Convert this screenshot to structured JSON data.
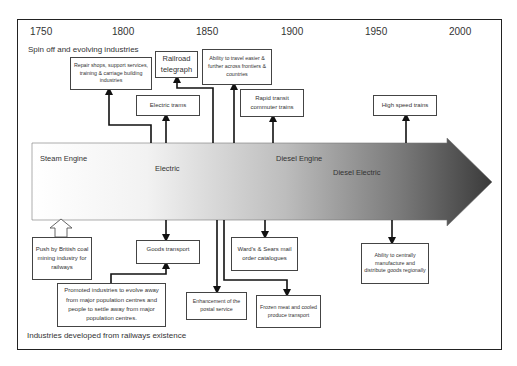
{
  "diagram": {
    "type": "timeline-flow-diagram",
    "years": [
      "1750",
      "1800",
      "1850",
      "1900",
      "1950",
      "2000"
    ],
    "top_section_label": "Spin off and evolving industries",
    "bottom_section_label": "Industries developed from railways existence",
    "timeline_arrow": {
      "eras": [
        "Steam Engine",
        "Electric",
        "Diesel Engine",
        "Diesel Electric"
      ],
      "gradient_start": "#ffffff",
      "gradient_end": "#3a3a3a"
    },
    "spin_off_boxes": [
      {
        "id": "repair",
        "label": "Repair shops, support services, training & carriage building industries"
      },
      {
        "id": "telegraph",
        "label": "Railroad telegraph"
      },
      {
        "id": "travel",
        "label": "Ability to travel easier & further across frontiers & countries"
      },
      {
        "id": "electric_trams",
        "label": "Electric trams"
      },
      {
        "id": "rapid_transit",
        "label": "Rapid transit commuter trains"
      },
      {
        "id": "high_speed",
        "label": "High speed trains"
      }
    ],
    "developed_boxes": [
      {
        "id": "push",
        "label": "Push by British coal mining industry for railways"
      },
      {
        "id": "goods",
        "label": "Goods transport"
      },
      {
        "id": "promoted",
        "label": "Promoted industries to evolve away from major population centres and people to settle away from major population centres."
      },
      {
        "id": "postal",
        "label": "Enhancement of the postal service"
      },
      {
        "id": "wards",
        "label": "Ward's & Sears mail order catalogues"
      },
      {
        "id": "frozen",
        "label": "Frozen meat and cooled produce transport"
      },
      {
        "id": "centrally",
        "label": "Ability to centrally manufacture and distribute goods regionally"
      }
    ]
  }
}
